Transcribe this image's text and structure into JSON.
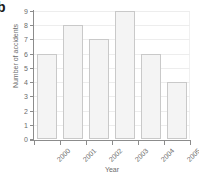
{
  "panel": {
    "label": "b"
  },
  "chart_data": {
    "type": "bar",
    "title": "",
    "xlabel": "Year",
    "ylabel": "Number of accidents",
    "categories": [
      "2000",
      "2001",
      "2002",
      "2003",
      "2004",
      "2005"
    ],
    "values": [
      6,
      8,
      7,
      9,
      6,
      4
    ],
    "ylim": [
      0,
      9
    ],
    "yticks": [
      "0",
      "1",
      "2",
      "3",
      "4",
      "5",
      "6",
      "7",
      "8",
      "9"
    ],
    "grid": true,
    "legend": "none",
    "colors": {
      "bar_fill": "#f4f4f4",
      "bar_border": "#c9c9c9",
      "axis": "#8c8c8c",
      "gridline": "#ededed",
      "text": "#6b6b6b"
    }
  }
}
